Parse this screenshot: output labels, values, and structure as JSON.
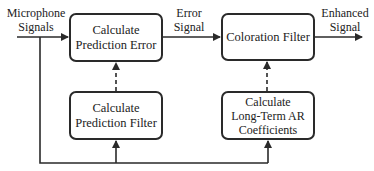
{
  "diagram": {
    "type": "signal-processing-block-diagram",
    "blocks": [
      {
        "id": "prediction-error",
        "lines": [
          "Calculate",
          "Prediction Error"
        ]
      },
      {
        "id": "coloration-filter",
        "lines": [
          "Coloration Filter"
        ]
      },
      {
        "id": "prediction-filter",
        "lines": [
          "Calculate",
          "Prediction Filter"
        ]
      },
      {
        "id": "ar-coefficients",
        "lines": [
          "Calculate",
          "Long-Term AR",
          "Coefficients"
        ]
      }
    ],
    "labels": {
      "input": [
        "Microphone",
        "Signals"
      ],
      "error": [
        "Error",
        "Signal"
      ],
      "output": [
        "Enhanced",
        "Signal"
      ]
    },
    "connections": [
      {
        "from": "input",
        "to": "prediction-error",
        "style": "solid"
      },
      {
        "from": "prediction-error",
        "to": "coloration-filter",
        "style": "solid",
        "label": "Error Signal"
      },
      {
        "from": "coloration-filter",
        "to": "output",
        "style": "solid",
        "label": "Enhanced Signal"
      },
      {
        "from": "prediction-filter",
        "to": "prediction-error",
        "style": "dashed"
      },
      {
        "from": "ar-coefficients",
        "to": "coloration-filter",
        "style": "dashed"
      },
      {
        "from": "input",
        "to": "prediction-filter",
        "style": "solid",
        "via": "bottom-bus"
      },
      {
        "from": "input",
        "to": "ar-coefficients",
        "style": "solid",
        "via": "bottom-bus"
      }
    ],
    "colors": {
      "stroke": "#2a2a2a",
      "background": "#ffffff",
      "text": "#222222"
    }
  }
}
